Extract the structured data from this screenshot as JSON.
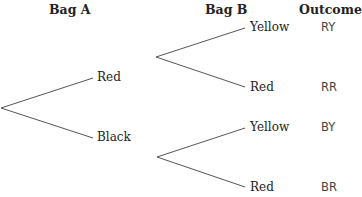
{
  "headers": {
    "bag_a": "Bag A",
    "bag_b": "Bag B",
    "outcome": "Outcome"
  },
  "tree": {
    "bag_a": [
      {
        "label": "Red"
      },
      {
        "label": "Black"
      }
    ],
    "bag_b": [
      {
        "label": "Yellow",
        "outcome": "RY"
      },
      {
        "label": "Red",
        "outcome": "RR"
      },
      {
        "label": "Yellow",
        "outcome": "BY"
      },
      {
        "label": "Red",
        "outcome": "BR"
      }
    ]
  },
  "colors": {
    "line": "#555555",
    "text": "#222222",
    "outcome_text": "#444444",
    "background": "#ffffff"
  }
}
